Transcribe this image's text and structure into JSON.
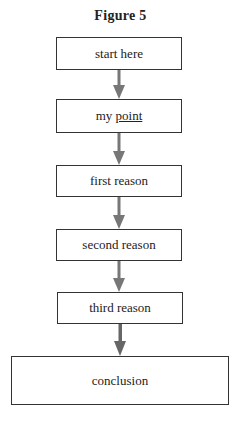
{
  "figure": {
    "title": "Figure 5",
    "nodes": [
      {
        "id": "start",
        "label": "start here"
      },
      {
        "id": "point",
        "label_prefix": "my ",
        "label_underlined": "point"
      },
      {
        "id": "reason1",
        "label": "first reason"
      },
      {
        "id": "reason2",
        "label": "second reason"
      },
      {
        "id": "reason3",
        "label": "third reason"
      },
      {
        "id": "conclusion",
        "label": "conclusion"
      }
    ],
    "edges": [
      {
        "from": "start",
        "to": "point"
      },
      {
        "from": "point",
        "to": "reason1"
      },
      {
        "from": "reason1",
        "to": "reason2"
      },
      {
        "from": "reason2",
        "to": "reason3"
      },
      {
        "from": "reason3",
        "to": "conclusion"
      }
    ],
    "colors": {
      "arrow": "#777777",
      "border": "#333333"
    }
  }
}
